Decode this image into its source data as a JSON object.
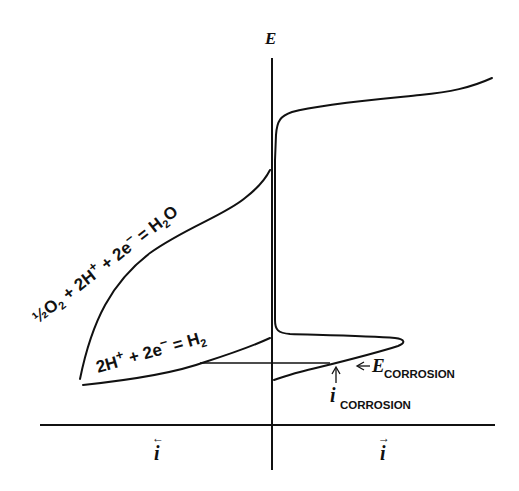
{
  "diagram": {
    "type": "polarization-diagram",
    "axes": {
      "y_label": "E",
      "x_left_label": "i",
      "x_right_label": "i",
      "x_left_arrow": "←",
      "x_right_arrow": "→"
    },
    "curves": [
      {
        "name": "oxygen-reduction",
        "label_parts": [
          "½O",
          "2",
          " + 2H",
          "+",
          " + 2e",
          "−",
          " = H",
          "2",
          "O"
        ]
      },
      {
        "name": "hydrogen-evolution",
        "label_parts": [
          "2H",
          "+",
          " + 2e",
          "−",
          " = H",
          "2"
        ]
      },
      {
        "name": "anodic-metal-dissolution-passivation",
        "label_parts": []
      }
    ],
    "annotations": {
      "e_corrosion": {
        "symbol": "E",
        "subscript": "CORROSION",
        "arrow": "←"
      },
      "i_corrosion": {
        "symbol": "i",
        "subscript": "CORROSION",
        "arrow": "↑"
      }
    }
  }
}
